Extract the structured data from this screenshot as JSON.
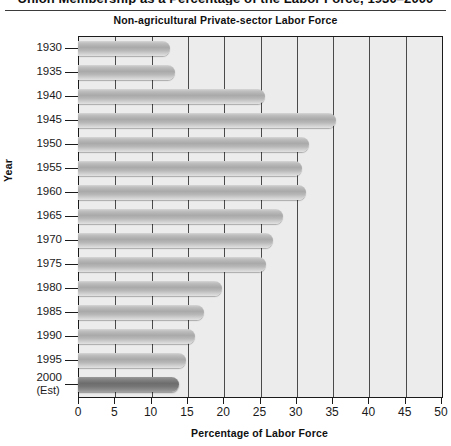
{
  "clipped_caption": "Union Membership as a Percentage of the Labor Force, 1930–2000",
  "chart_data": {
    "type": "bar",
    "orientation": "horizontal",
    "title": "Non-agricultural Private-sector Labor Force",
    "xlabel": "Percentage of Labor Force",
    "ylabel": "Year",
    "xlim": [
      0,
      50
    ],
    "xticks": [
      0,
      5,
      10,
      15,
      20,
      25,
      30,
      35,
      40,
      45,
      50
    ],
    "grid": "vertical",
    "legend": "none",
    "categories": [
      "1930",
      "1935",
      "1940",
      "1945",
      "1950",
      "1955",
      "1960",
      "1965",
      "1970",
      "1975",
      "1980",
      "1985",
      "1990",
      "1995",
      "2000"
    ],
    "category_sublabels": {
      "2000": "(Est)"
    },
    "values": [
      12.7,
      13.3,
      25.7,
      35.5,
      31.8,
      30.9,
      31.4,
      28.2,
      26.8,
      25.9,
      19.8,
      17.4,
      16.1,
      14.9,
      13.9
    ],
    "highlight_index": 14,
    "colors": {
      "bar": "#b0b0b0",
      "bar_highlight": "#727272",
      "plot_background": "#ececec",
      "axis": "#1b1b1b",
      "gridline": "#4a4a4a",
      "text": "#1a1a1a"
    }
  }
}
